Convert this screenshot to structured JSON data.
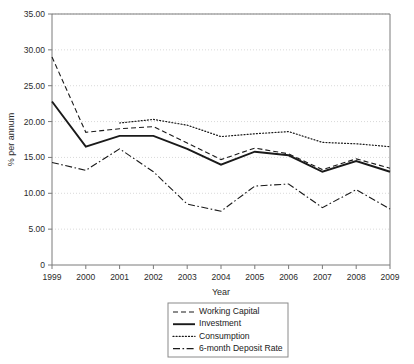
{
  "chart_data": {
    "type": "line",
    "title": "",
    "xlabel": "Year",
    "ylabel": "% per annum",
    "x": [
      1999,
      2000,
      2001,
      2002,
      2003,
      2004,
      2005,
      2006,
      2007,
      2008,
      2009
    ],
    "categories": [
      "1999",
      "2000",
      "2001",
      "2002",
      "2003",
      "2004",
      "2005",
      "2006",
      "2007",
      "2008",
      "2009"
    ],
    "xlim": [
      1999,
      2009
    ],
    "ylim": [
      0,
      35
    ],
    "yticks": [
      0,
      5,
      10,
      15,
      20,
      25,
      30,
      35
    ],
    "ytick_labels": [
      "0",
      "5.00",
      "10.00",
      "15.00",
      "20.00",
      "25.00",
      "30.00",
      "35.00"
    ],
    "grid": true,
    "grid_axis": "y",
    "legend_position": "bottom-center",
    "series": [
      {
        "name": "Working Capital",
        "style": "dashed",
        "values": [
          29.0,
          18.5,
          19.0,
          19.3,
          17.0,
          14.7,
          16.3,
          15.5,
          13.3,
          14.8,
          13.5
        ]
      },
      {
        "name": "Investment",
        "style": "solid",
        "values": [
          22.8,
          16.5,
          18.0,
          18.0,
          16.2,
          14.0,
          15.8,
          15.3,
          13.0,
          14.5,
          13.0
        ]
      },
      {
        "name": "Consumption",
        "style": "dotted",
        "values": [
          null,
          null,
          19.8,
          20.3,
          19.5,
          17.9,
          18.3,
          18.6,
          17.1,
          16.9,
          16.5
        ]
      },
      {
        "name": "6-month Deposit Rate",
        "style": "dash-dot",
        "values": [
          14.3,
          13.2,
          16.2,
          13.0,
          8.5,
          7.5,
          11.0,
          11.3,
          8.0,
          10.5,
          7.8
        ]
      }
    ]
  },
  "legend": {
    "items": [
      {
        "label": "Working Capital",
        "style": "dashed"
      },
      {
        "label": "Investment",
        "style": "solid"
      },
      {
        "label": "Consumption",
        "style": "dotted"
      },
      {
        "label": "6-month Deposit Rate",
        "style": "dash-dot"
      }
    ]
  },
  "colors": {
    "ink": "#1a1a1a",
    "axis": "#7a7a7a",
    "grid": "#cfcfcf",
    "background": "#ffffff"
  }
}
